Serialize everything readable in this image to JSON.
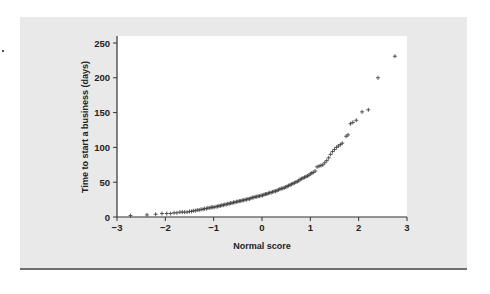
{
  "chart_data": {
    "type": "scatter",
    "title": "",
    "xlabel": "Normal score",
    "ylabel": "Time to start a business (days)",
    "xlim": [
      -3,
      3
    ],
    "ylim": [
      0,
      260
    ],
    "xticks": [
      -3,
      -2,
      -1,
      0,
      1,
      2,
      3
    ],
    "xtick_labels": [
      "−3",
      "−2",
      "−1",
      "0",
      "1",
      "2",
      "3"
    ],
    "yticks": [
      0,
      50,
      100,
      150,
      200,
      250
    ],
    "ytick_labels": [
      "0",
      "50",
      "100",
      "150",
      "200",
      "250"
    ],
    "grid": false,
    "legend": null,
    "marker": "+",
    "series": [
      {
        "name": "Time to start a business",
        "points": [
          [
            -2.72,
            2
          ],
          [
            -2.38,
            3
          ],
          [
            -2.2,
            4
          ],
          [
            -2.07,
            5
          ],
          [
            -1.97,
            5
          ],
          [
            -1.89,
            5
          ],
          [
            -1.82,
            6
          ],
          [
            -1.76,
            6
          ],
          [
            -1.7,
            7
          ],
          [
            -1.65,
            7
          ],
          [
            -1.6,
            7
          ],
          [
            -1.55,
            7
          ],
          [
            -1.5,
            8
          ],
          [
            -1.46,
            8
          ],
          [
            -1.42,
            9
          ],
          [
            -1.38,
            9
          ],
          [
            -1.34,
            10
          ],
          [
            -1.3,
            10
          ],
          [
            -1.26,
            11
          ],
          [
            -1.22,
            11
          ],
          [
            -1.19,
            12
          ],
          [
            -1.15,
            12
          ],
          [
            -1.12,
            13
          ],
          [
            -1.08,
            13
          ],
          [
            -1.05,
            14
          ],
          [
            -1.02,
            14
          ],
          [
            -0.99,
            14
          ],
          [
            -0.95,
            15
          ],
          [
            -0.92,
            15
          ],
          [
            -0.89,
            16
          ],
          [
            -0.86,
            16
          ],
          [
            -0.83,
            17
          ],
          [
            -0.8,
            17
          ],
          [
            -0.77,
            18
          ],
          [
            -0.74,
            18
          ],
          [
            -0.71,
            19
          ],
          [
            -0.68,
            19
          ],
          [
            -0.65,
            20
          ],
          [
            -0.62,
            20
          ],
          [
            -0.59,
            21
          ],
          [
            -0.56,
            21
          ],
          [
            -0.53,
            22
          ],
          [
            -0.5,
            22
          ],
          [
            -0.47,
            23
          ],
          [
            -0.44,
            23
          ],
          [
            -0.41,
            24
          ],
          [
            -0.38,
            24
          ],
          [
            -0.35,
            25
          ],
          [
            -0.32,
            25
          ],
          [
            -0.29,
            26
          ],
          [
            -0.26,
            26
          ],
          [
            -0.23,
            27
          ],
          [
            -0.2,
            28
          ],
          [
            -0.17,
            28
          ],
          [
            -0.14,
            29
          ],
          [
            -0.11,
            29
          ],
          [
            -0.08,
            30
          ],
          [
            -0.05,
            30
          ],
          [
            -0.02,
            31
          ],
          [
            0.01,
            31
          ],
          [
            0.04,
            32
          ],
          [
            0.07,
            33
          ],
          [
            0.1,
            33
          ],
          [
            0.13,
            34
          ],
          [
            0.16,
            35
          ],
          [
            0.19,
            35
          ],
          [
            0.22,
            36
          ],
          [
            0.25,
            37
          ],
          [
            0.28,
            37
          ],
          [
            0.31,
            38
          ],
          [
            0.34,
            39
          ],
          [
            0.37,
            40
          ],
          [
            0.4,
            41
          ],
          [
            0.43,
            41
          ],
          [
            0.46,
            42
          ],
          [
            0.49,
            43
          ],
          [
            0.52,
            44
          ],
          [
            0.55,
            45
          ],
          [
            0.58,
            46
          ],
          [
            0.61,
            47
          ],
          [
            0.64,
            48
          ],
          [
            0.67,
            49
          ],
          [
            0.7,
            50
          ],
          [
            0.73,
            51
          ],
          [
            0.76,
            52
          ],
          [
            0.79,
            54
          ],
          [
            0.82,
            55
          ],
          [
            0.85,
            56
          ],
          [
            0.88,
            57
          ],
          [
            0.91,
            58
          ],
          [
            0.94,
            59
          ],
          [
            0.97,
            60
          ],
          [
            1.0,
            62
          ],
          [
            1.03,
            63
          ],
          [
            1.06,
            64
          ],
          [
            1.1,
            66
          ],
          [
            1.14,
            72
          ],
          [
            1.18,
            73
          ],
          [
            1.22,
            74
          ],
          [
            1.26,
            75
          ],
          [
            1.3,
            78
          ],
          [
            1.34,
            81
          ],
          [
            1.38,
            85
          ],
          [
            1.42,
            90
          ],
          [
            1.46,
            94
          ],
          [
            1.5,
            97
          ],
          [
            1.54,
            100
          ],
          [
            1.58,
            102
          ],
          [
            1.62,
            104
          ],
          [
            1.66,
            106
          ],
          [
            1.74,
            116
          ],
          [
            1.78,
            118
          ],
          [
            1.83,
            134
          ],
          [
            1.88,
            136
          ],
          [
            1.95,
            139
          ],
          [
            2.07,
            151
          ],
          [
            2.2,
            154
          ],
          [
            2.4,
            200
          ],
          [
            2.75,
            231
          ]
        ]
      }
    ]
  },
  "figure": {
    "ylabel": "Time to start a business (days)",
    "xlabel": "Normal score",
    "colors": {
      "panel_bg": "#e9e9e9",
      "plot_bg": "#ffffff",
      "axis": "#333333",
      "marker": "#444444",
      "rule": "#6e6e6e"
    }
  }
}
